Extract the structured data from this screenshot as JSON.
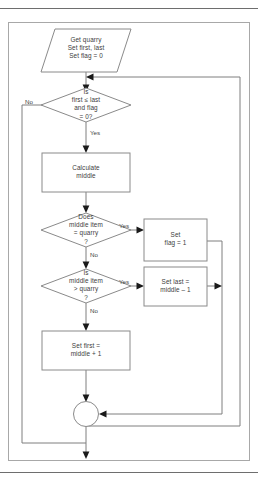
{
  "diagram": {
    "colors": {
      "shape_stroke": "#8a8a8a",
      "connector_stroke": "#7f7f7f",
      "arrow_fill": "#1a1a1a",
      "text": "#3d3d3d",
      "frame": "#6e6e6e",
      "background": "#ffffff"
    },
    "nodes": {
      "start": {
        "shape": "parallelogram",
        "text": "Get quarry\nSet first, last\nSet flag = 0"
      },
      "loop_condition": {
        "shape": "diamond",
        "text": "Is\nfirst ≤ last\nand flag\n= 0?"
      },
      "calculate_middle": {
        "shape": "rectangle",
        "text": "Calculate\nmiddle"
      },
      "equal_check": {
        "shape": "diamond",
        "text": "Does\nmiddle item\n= quarry\n?"
      },
      "set_flag": {
        "shape": "rectangle",
        "text": "Set\nflag = 1"
      },
      "greater_check": {
        "shape": "diamond",
        "text": "Is\nmiddle item\n> quarry\n?"
      },
      "set_last": {
        "shape": "rectangle",
        "text": "Set last =\nmiddle – 1"
      },
      "set_first": {
        "shape": "rectangle",
        "text": "Set first =\nmiddle + 1"
      },
      "connector": {
        "shape": "circle",
        "text": ""
      }
    },
    "edge_labels": {
      "loop_no": "No",
      "loop_yes": "Yes",
      "equal_yes": "Yes",
      "equal_no": "No",
      "greater_yes": "Yes",
      "greater_no": "No"
    }
  }
}
